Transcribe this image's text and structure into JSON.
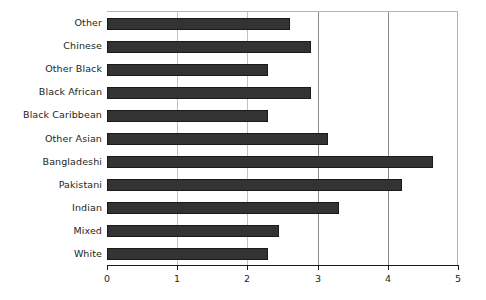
{
  "chart_data": {
    "type": "bar",
    "orientation": "horizontal",
    "title": "",
    "subtitle": "",
    "xlabel": "",
    "ylabel": "",
    "xlim": [
      0,
      5
    ],
    "ylim": null,
    "grid": true,
    "grid_axis": "x",
    "legend": false,
    "legend_position": "none",
    "xticks": [
      "0",
      "1",
      "2",
      "3",
      "4",
      "5"
    ],
    "xtick_values": [
      0,
      1,
      2,
      3,
      4,
      5
    ],
    "categories": [
      "Other",
      "Chinese",
      "Other Black",
      "Black African",
      "Black Caribbean",
      "Other Asian",
      "Bangladeshi",
      "Pakistani",
      "Indian",
      "Mixed",
      "White"
    ],
    "values": [
      2.6,
      2.9,
      2.3,
      2.9,
      2.3,
      3.15,
      4.65,
      4.2,
      3.3,
      2.45,
      2.3
    ],
    "bar_color": "#333333",
    "bar_edge_color": "#1a1a1a",
    "background_color": "#ffffff",
    "gridline_color": "#8c8c8c",
    "axis_color": "#1a1a1a"
  }
}
